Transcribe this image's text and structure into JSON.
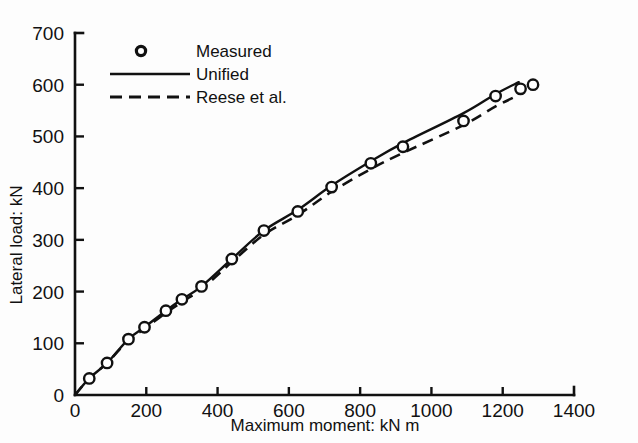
{
  "chart_data": {
    "type": "line",
    "title": "",
    "xlabel": "Maximum moment: kN m",
    "ylabel": "Lateral load: kN",
    "xlim": [
      0,
      1400
    ],
    "ylim": [
      0,
      700
    ],
    "xticks": [
      0,
      200,
      400,
      600,
      800,
      1000,
      1200,
      1400
    ],
    "yticks": [
      0,
      100,
      200,
      300,
      400,
      500,
      600,
      700
    ],
    "xtick_labels": [
      "0",
      "200",
      "400",
      "600",
      "800",
      "1000",
      "1200",
      "1400"
    ],
    "ytick_labels": [
      "0",
      "100",
      "200",
      "300",
      "400",
      "500",
      "600",
      "700"
    ],
    "grid": false,
    "legend_position": "top-left",
    "series": [
      {
        "name": "Measured",
        "style": "marker",
        "marker": "open-circle",
        "color": "#111111",
        "x": [
          40,
          90,
          150,
          195,
          255,
          300,
          355,
          440,
          530,
          625,
          720,
          830,
          920,
          1090,
          1180,
          1250,
          1285
        ],
        "y": [
          32,
          62,
          108,
          131,
          163,
          185,
          210,
          263,
          318,
          355,
          402,
          448,
          480,
          530,
          578,
          592,
          600
        ]
      },
      {
        "name": "Unified",
        "style": "solid-line",
        "color": "#111111",
        "x": [
          0,
          40,
          90,
          150,
          195,
          255,
          300,
          355,
          440,
          530,
          625,
          720,
          830,
          920,
          1090,
          1180,
          1245
        ],
        "y": [
          0,
          32,
          62,
          108,
          131,
          163,
          185,
          210,
          263,
          318,
          358,
          405,
          452,
          487,
          545,
          582,
          605
        ]
      },
      {
        "name": "Reese et al.",
        "style": "dashed-line",
        "color": "#111111",
        "x": [
          0,
          40,
          90,
          150,
          195,
          255,
          300,
          355,
          440,
          530,
          625,
          720,
          830,
          920,
          1090,
          1180,
          1245
        ],
        "y": [
          0,
          32,
          62,
          106,
          128,
          159,
          180,
          205,
          257,
          310,
          348,
          393,
          437,
          468,
          522,
          558,
          580
        ]
      }
    ],
    "legend_entries": [
      {
        "label": "Measured",
        "style": "open-circle"
      },
      {
        "label": "Unified",
        "style": "solid-line"
      },
      {
        "label": "Reese et al.",
        "style": "dashed-line"
      }
    ]
  },
  "axes": {
    "x_axis_title": "Maximum moment: kN m",
    "y_axis_title": "Lateral load: kN"
  }
}
